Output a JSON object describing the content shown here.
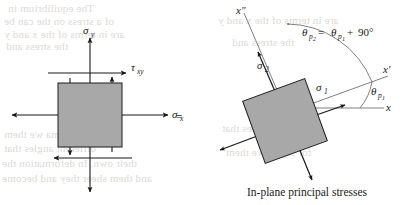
{
  "figure": {
    "caption": "In-plane principal stresses",
    "equals_sign": "=",
    "colors": {
      "element_fill": "#a8a8a8",
      "element_stroke": "#1d1d1d",
      "arrow": "#181818",
      "arc": "#4a4a4a",
      "text": "#1a1a1a",
      "bleed_through": "#ded9d4",
      "background": "#ffffff"
    },
    "left_element": {
      "name": "general-stress-element",
      "labels": {
        "sigma_y": {
          "symbol": "σ",
          "subscript": "y"
        },
        "sigma_x": {
          "symbol": "σ",
          "subscript": "x"
        },
        "tau_xy": {
          "symbol": "τ",
          "subscript": "xy"
        }
      },
      "arrows": [
        {
          "name": "sigma-y-top-arrow",
          "direction": "up"
        },
        {
          "name": "sigma-y-bottom-arrow",
          "direction": "down"
        },
        {
          "name": "sigma-x-right-arrow",
          "direction": "right"
        },
        {
          "name": "sigma-x-left-arrow",
          "direction": "left"
        },
        {
          "name": "tau-xy-top-arrow",
          "direction": "right"
        },
        {
          "name": "tau-xy-bottom-arrow",
          "direction": "left"
        },
        {
          "name": "tau-xy-left-arrow",
          "direction": "down"
        },
        {
          "name": "tau-xy-right-arrow",
          "direction": "up"
        }
      ]
    },
    "right_element": {
      "name": "principal-stress-element",
      "rotation_deg": 20,
      "labels": {
        "sigma_1": {
          "symbol": "σ",
          "subscript": "1"
        },
        "sigma_2": {
          "symbol": "σ",
          "subscript": "2"
        },
        "axis_x": "x",
        "axis_x_prime": "x′",
        "axis_x_double_prime": "x″",
        "theta_p1": {
          "symbol": "θ",
          "subscript": "p",
          "subsub": "1"
        }
      },
      "equation": {
        "lhs_symbol": "θ",
        "lhs_sub": "p",
        "lhs_subsub": "2",
        "equals": "=",
        "rhs_symbol": "θ",
        "rhs_sub": "p",
        "rhs_subsub": "1",
        "plus": "+",
        "value": "90°"
      },
      "arcs": [
        {
          "name": "theta-p2-arc"
        },
        {
          "name": "theta-p1-arc"
        }
      ]
    }
  },
  "bleed_text": {
    "line1": "The equilibrium in",
    "line2": "of a stress on the can be",
    "line3": "are in terms of the x and y",
    "line4": "the stress and",
    "line5": "for sigma we them",
    "line6": "different angles that",
    "line7": "their own. In deformation the",
    "line8": "and them sheer they and become"
  }
}
